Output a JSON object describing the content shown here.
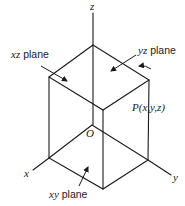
{
  "figure": {
    "type": "3d-coordinate-box",
    "axes": {
      "x": {
        "label": "x"
      },
      "y": {
        "label": "y"
      },
      "z": {
        "label": "z"
      }
    },
    "origin": {
      "label": "O"
    },
    "point": {
      "label": "P(x,y,z)"
    },
    "planes": [
      {
        "id": "xz",
        "label_var": "xz",
        "label_word": "plane"
      },
      {
        "id": "yz",
        "label_var": "yz",
        "label_word": "plane"
      },
      {
        "id": "xy",
        "label_var": "xy",
        "label_word": "plane"
      }
    ],
    "colors": {
      "stroke": "#1a1a1a",
      "background": "#ffffff"
    }
  }
}
